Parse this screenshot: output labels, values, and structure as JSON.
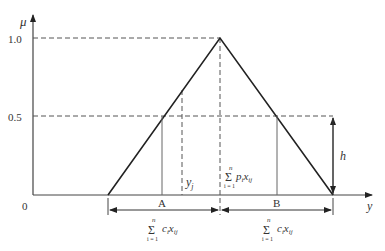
{
  "diagram": {
    "type": "triangular fuzzy membership function",
    "y_axis_label": "μ",
    "x_axis_label": "y",
    "ticks": {
      "one": "1.0",
      "half": "0.5",
      "zero": "0"
    },
    "points": {
      "A": "A",
      "B": "B"
    },
    "labels": {
      "yj": "y",
      "yj_sub": "j",
      "h": "h",
      "center_sum": {
        "top": "n",
        "bottom": "i = 1",
        "body": "p",
        "sub_i": "i",
        "x": "x",
        "sub_ij": "ij"
      },
      "left_sum": {
        "top": "n",
        "bottom": "i = 1",
        "body": "c",
        "sub_i": "i",
        "x": "x",
        "sub_ij": "ij"
      },
      "right_sum": {
        "top": "n",
        "bottom": "i = 1",
        "body": "c",
        "sub_i": "i",
        "x": "x",
        "sub_ij": "ij"
      },
      "sigma": "Σ"
    }
  }
}
